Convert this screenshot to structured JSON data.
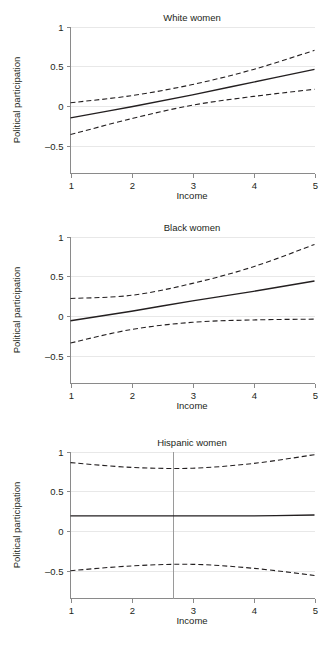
{
  "figure": {
    "axis_titles": {
      "x": "Income",
      "y": "Political participation"
    },
    "x_ticks": [
      "1",
      "2",
      "3",
      "4",
      "5"
    ],
    "y_ticks": [
      "1",
      "0.5",
      "0",
      "-0.5"
    ],
    "colors": {
      "line": "#231f20",
      "grid": "#e8e8e8",
      "axis": "#8a8a8a",
      "reference": "#9a9a9a",
      "background": "#ffffff"
    }
  },
  "chart_data": [
    {
      "type": "line",
      "title": "White women",
      "xlabel": "Income",
      "ylabel": "Political participation",
      "xlim": [
        1,
        5
      ],
      "ylim": [
        -0.85,
        1.0
      ],
      "x_ticks": [
        1,
        2,
        3,
        4,
        5
      ],
      "y_ticks": [
        -0.5,
        0,
        0.5,
        1
      ],
      "grid": true,
      "legend": "none",
      "x": [
        1,
        2,
        3,
        4,
        5
      ],
      "series": [
        {
          "name": "Predicted political participation",
          "style": "solid",
          "values": [
            -0.15,
            -0.01,
            0.14,
            0.3,
            0.46
          ]
        },
        {
          "name": "Upper 95% confidence bound",
          "style": "dashed",
          "values": [
            0.04,
            0.13,
            0.27,
            0.46,
            0.7
          ]
        },
        {
          "name": "Lower 95% confidence bound",
          "style": "dashed",
          "values": [
            -0.36,
            -0.16,
            0.01,
            0.12,
            0.21
          ]
        }
      ]
    },
    {
      "type": "line",
      "title": "Black women",
      "xlabel": "Income",
      "ylabel": "Political participation",
      "xlim": [
        1,
        5
      ],
      "ylim": [
        -0.85,
        1.0
      ],
      "x_ticks": [
        1,
        2,
        3,
        4,
        5
      ],
      "y_ticks": [
        -0.5,
        0,
        0.5,
        1
      ],
      "grid": true,
      "legend": "none",
      "x": [
        1,
        2,
        3,
        4,
        5
      ],
      "series": [
        {
          "name": "Predicted political participation",
          "style": "solid",
          "values": [
            -0.06,
            0.06,
            0.19,
            0.31,
            0.44
          ]
        },
        {
          "name": "Upper 95% confidence bound",
          "style": "dashed",
          "values": [
            0.22,
            0.26,
            0.41,
            0.62,
            0.9
          ]
        },
        {
          "name": "Lower 95% confidence bound",
          "style": "dashed",
          "values": [
            -0.34,
            -0.17,
            -0.08,
            -0.05,
            -0.04
          ]
        }
      ]
    },
    {
      "type": "line",
      "title": "Hispanic women",
      "xlabel": "Income",
      "ylabel": "Political participation",
      "xlim": [
        1,
        5
      ],
      "ylim": [
        -0.85,
        1.0
      ],
      "x_ticks": [
        1,
        2,
        3,
        4,
        5
      ],
      "y_ticks": [
        -0.5,
        0,
        0.5,
        1
      ],
      "grid": true,
      "legend": "none",
      "reference_line_x": 2.68,
      "x": [
        1,
        2,
        3,
        4,
        5
      ],
      "series": [
        {
          "name": "Predicted political participation",
          "style": "solid",
          "values": [
            0.19,
            0.19,
            0.19,
            0.19,
            0.2
          ]
        },
        {
          "name": "Upper 95% confidence bound",
          "style": "dashed",
          "values": [
            0.86,
            0.8,
            0.79,
            0.85,
            0.96
          ]
        },
        {
          "name": "Lower 95% confidence bound",
          "style": "dashed",
          "values": [
            -0.5,
            -0.44,
            -0.42,
            -0.47,
            -0.56
          ]
        }
      ]
    }
  ]
}
